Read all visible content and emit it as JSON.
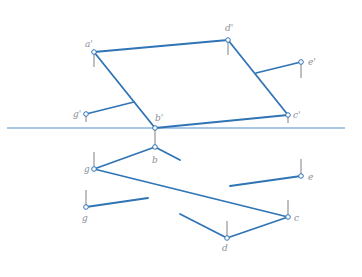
{
  "figure": {
    "type": "descriptive-geometry orthographic projection",
    "colors": {
      "edge": "#2f74b5",
      "axis": "#4f8fcc",
      "label": "#8a9098",
      "tick": "#6e7379",
      "background": "#ffffff"
    },
    "axis_line": {
      "x1": 7,
      "y1": 128,
      "x2": 345,
      "y2": 128
    },
    "front_view": {
      "points": [
        {
          "id": "a1",
          "label": "a'",
          "x": 94,
          "y": 52,
          "lx": 85,
          "ly": 47
        },
        {
          "id": "d1",
          "label": "d'",
          "x": 228,
          "y": 40,
          "lx": 226,
          "ly": 31
        },
        {
          "id": "e1",
          "label": "e'",
          "x": 301,
          "y": 62,
          "lx": 308,
          "ly": 65
        },
        {
          "id": "c1",
          "label": "c'",
          "x": 288,
          "y": 115,
          "lx": 293,
          "ly": 118
        },
        {
          "id": "b1",
          "label": "b'",
          "x": 155,
          "y": 128,
          "lx": 155,
          "ly": 121
        },
        {
          "id": "g1",
          "label": "g'",
          "x": 86,
          "y": 114,
          "lx": 74,
          "ly": 117
        }
      ]
    },
    "top_view": {
      "points": [
        {
          "id": "b",
          "label": "b",
          "x": 155,
          "y": 147,
          "lx": 152,
          "ly": 163
        },
        {
          "id": "a",
          "label": "g",
          "x": 94,
          "y": 169,
          "lx": 84,
          "ly": 172
        },
        {
          "id": "g",
          "label": "g",
          "x": 86,
          "y": 207,
          "lx": 82,
          "ly": 221
        },
        {
          "id": "e",
          "label": "e",
          "x": 301,
          "y": 176,
          "lx": 308,
          "ly": 180
        },
        {
          "id": "c",
          "label": "c",
          "x": 288,
          "y": 217,
          "lx": 294,
          "ly": 221
        },
        {
          "id": "d",
          "label": "d",
          "x": 227,
          "y": 238,
          "lx": 222,
          "ly": 251
        }
      ]
    }
  }
}
